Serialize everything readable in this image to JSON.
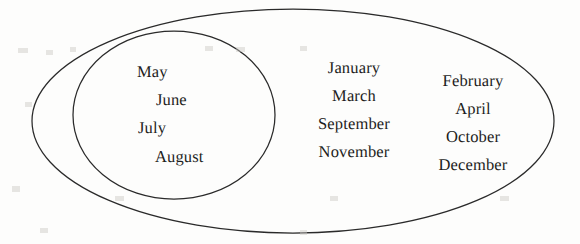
{
  "diagram": {
    "type": "euler-set-diagram",
    "stroke_color": "#2a2a2a",
    "background_color": "#fdfdfc",
    "text_color": "#1d1d1d",
    "outer_set": {
      "name": "outer-ellipse",
      "shape": "ellipse",
      "cx": 293,
      "cy": 121,
      "rx": 261,
      "ry": 112
    },
    "inner_set": {
      "name": "inner-circle",
      "shape": "ellipse",
      "cx": 174,
      "cy": 115,
      "rx": 101,
      "ry": 84
    },
    "inner_items": [
      {
        "label": "May"
      },
      {
        "label": "June"
      },
      {
        "label": "July"
      },
      {
        "label": "August"
      }
    ],
    "outer_items_column_1": [
      {
        "label": "January"
      },
      {
        "label": "March"
      },
      {
        "label": "September"
      },
      {
        "label": "November"
      }
    ],
    "outer_items_column_2": [
      {
        "label": "February"
      },
      {
        "label": "April"
      },
      {
        "label": "October"
      },
      {
        "label": "December"
      }
    ]
  }
}
